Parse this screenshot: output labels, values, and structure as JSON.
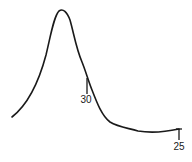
{
  "diagram": {
    "type": "hand-drawn peak curve",
    "stroke_color": "#1a1a1a",
    "background": "#ffffff",
    "markers": [
      {
        "label": "30",
        "position": "descending slope of peak"
      },
      {
        "label": "25",
        "position": "end of tail baseline"
      }
    ]
  }
}
